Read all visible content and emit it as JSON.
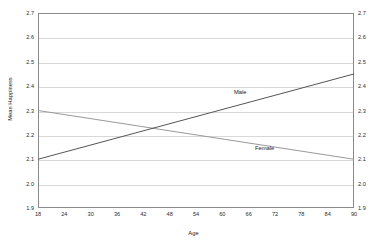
{
  "chart_data": {
    "type": "line",
    "title": "",
    "subtitle": "",
    "xlabel": "Age",
    "ylabel": "Mean Happiness",
    "xlim": [
      18,
      90
    ],
    "ylim": [
      1.9,
      2.7
    ],
    "xticks": [
      "18",
      "24",
      "30",
      "36",
      "42",
      "48",
      "54",
      "60",
      "66",
      "72",
      "78",
      "84",
      "90"
    ],
    "yticks": [
      "2.7",
      "2.6",
      "2.5",
      "2.4",
      "2.3",
      "2.2",
      "2.1",
      "2.0",
      "1.9"
    ],
    "yticks_right": [
      "2.7",
      "2.6",
      "2.5",
      "2.4",
      "2.3",
      "2.2",
      "2.1",
      "2.0",
      "1.9"
    ],
    "grid": true,
    "dual_y_axis": true,
    "legend_position": "inline-annotation",
    "series": [
      {
        "name": "Male",
        "color": "#555555",
        "x": [
          18,
          90
        ],
        "values": [
          2.1,
          2.45
        ],
        "annotation": "Male"
      },
      {
        "name": "Female",
        "color": "#999999",
        "x": [
          18,
          90
        ],
        "values": [
          2.3,
          2.1
        ],
        "annotation": "Female"
      }
    ],
    "crossing_point": {
      "x": 48,
      "y": 2.22
    }
  },
  "colors": {
    "male_line": "#555555",
    "female_line": "#999999",
    "grid": "#d8d8d8",
    "axis": "#8a8a8a",
    "background": "#ffffff",
    "text": "#1a1a1a"
  }
}
